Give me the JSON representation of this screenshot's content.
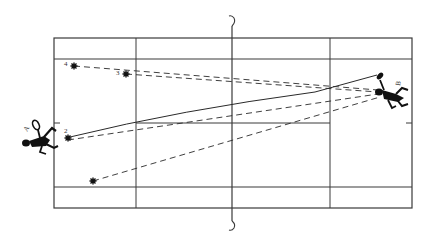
{
  "diagram": {
    "type": "tennis-court-shot-diagram",
    "colors": {
      "line": "#3a3a3a",
      "ink": "#111111",
      "background": "#ffffff"
    },
    "court": {
      "outer": {
        "x1": 54,
        "y1": 38,
        "x2": 412,
        "y2": 208
      },
      "singles_top_y": 59,
      "singles_bottom_y": 187,
      "service_left_x": 136,
      "service_right_x": 330,
      "center_line_y": 123,
      "net_x": 232
    },
    "players": [
      {
        "id": "A",
        "label": "A",
        "x": 40,
        "y": 130,
        "side": "left"
      },
      {
        "id": "B",
        "label": "B",
        "x": 386,
        "y": 96,
        "side": "right"
      }
    ],
    "targets": [
      {
        "label": "4",
        "x": 74,
        "y": 66
      },
      {
        "label": "3",
        "x": 126,
        "y": 74
      },
      {
        "label": "2",
        "x": 68,
        "y": 138
      },
      {
        "label": "",
        "x": 93,
        "y": 181
      }
    ],
    "paths": [
      {
        "name": "shot-to-4",
        "style": "dashed",
        "from": [
          74,
          66
        ],
        "to": [
          378,
          90
        ]
      },
      {
        "name": "shot-to-3",
        "style": "dashed",
        "from": [
          126,
          74
        ],
        "to": [
          378,
          92
        ]
      },
      {
        "name": "shot-to-2",
        "style": "dashed",
        "from": [
          68,
          140
        ],
        "to": [
          378,
          94
        ]
      },
      {
        "name": "shot-unlabeled",
        "style": "dashed",
        "from": [
          93,
          181
        ],
        "to": [
          380,
          97
        ]
      },
      {
        "name": "return-from-A",
        "style": "solid",
        "from": [
          70,
          137
        ],
        "to": [
          377,
          75
        ]
      }
    ]
  }
}
